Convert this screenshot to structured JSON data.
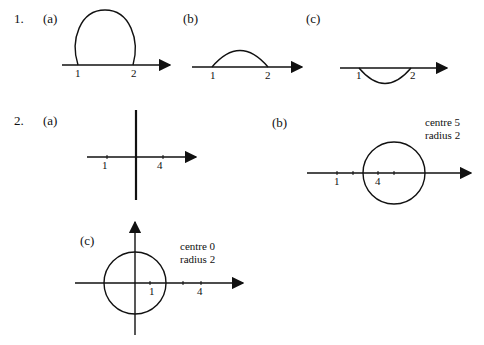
{
  "questions": [
    {
      "number": "1.",
      "parts": [
        {
          "label": "(a)",
          "ticks": [
            "1",
            "2"
          ],
          "shape": "major arc above axis"
        },
        {
          "label": "(b)",
          "ticks": [
            "1",
            "2"
          ],
          "shape": "minor arc above axis"
        },
        {
          "label": "(c)",
          "ticks": [
            "1",
            "2"
          ],
          "shape": "arc below axis"
        }
      ]
    },
    {
      "number": "2.",
      "parts": [
        {
          "label": "(a)",
          "ticks": [
            "1",
            "4"
          ],
          "shape": "vertical line"
        },
        {
          "label": "(b)",
          "ticks": [
            "1",
            "4"
          ],
          "shape": "circle",
          "note_line1": "centre 5",
          "note_line2": "radius 2"
        },
        {
          "label": "(c)",
          "ticks": [
            "1",
            "4"
          ],
          "shape": "circle",
          "note_line1": "centre 0",
          "note_line2": "radius 2"
        }
      ]
    }
  ],
  "colors": {
    "ink": "#111111",
    "background": "#ffffff"
  }
}
